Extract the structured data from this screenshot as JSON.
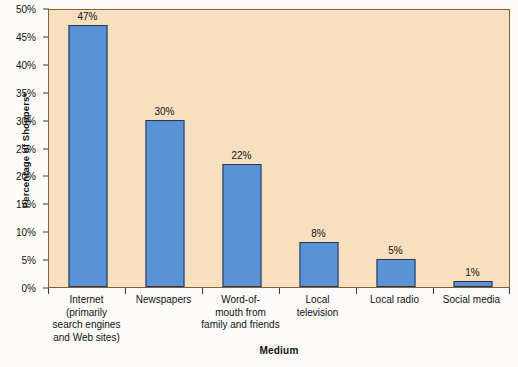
{
  "chart_data": {
    "type": "bar",
    "title": "",
    "xlabel": "Medium",
    "ylabel": "Percentage of Shoppers*",
    "categories": [
      "Internet (primarily search engines and Web sites)",
      "Newspapers",
      "Word-of-mouth from family and friends",
      "Local television",
      "Local radio",
      "Social media"
    ],
    "category_lines": [
      [
        "Internet",
        "(primarily",
        "search engines",
        "and Web sites)"
      ],
      [
        "Newspapers"
      ],
      [
        "Word-of-",
        "mouth from",
        "family and friends"
      ],
      [
        "Local",
        "television"
      ],
      [
        "Local radio"
      ],
      [
        "Social media"
      ]
    ],
    "values": [
      47,
      30,
      22,
      8,
      5,
      1
    ],
    "value_labels": [
      "47%",
      "30%",
      "22%",
      "8%",
      "5%",
      "1%"
    ],
    "ylim": [
      0,
      50
    ],
    "y_ticks": [
      0,
      5,
      10,
      15,
      20,
      25,
      30,
      35,
      40,
      45,
      50
    ],
    "y_tick_labels": [
      "0%",
      "5%",
      "10%",
      "15%",
      "20%",
      "25%",
      "30%",
      "35%",
      "40%",
      "45%",
      "50%"
    ],
    "grid": false,
    "legend": "none",
    "bar_color": "#5a92d8",
    "bar_border_color": "#27344c",
    "plot_background": "#f7dfc0",
    "frame_color": "#8a6030"
  }
}
